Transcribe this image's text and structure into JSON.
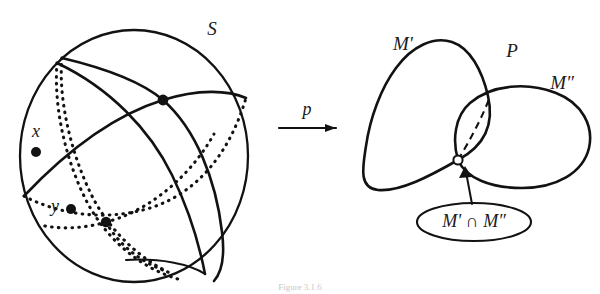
{
  "figure": {
    "kind": "mathematical-diagram",
    "background_color": "#ffffff",
    "ink_color": "#121212"
  },
  "left_panel": {
    "name": "sphere-panel",
    "sphere_label": "S",
    "point_labels": {
      "x": "x",
      "y": "y"
    }
  },
  "map_arrow": {
    "label": "p"
  },
  "right_panel": {
    "name": "quotient-panel",
    "loop_left_label": "M'",
    "space_label": "P",
    "loop_right_label": "M″",
    "intersection_label": "M' ∩ M″"
  },
  "caption": {
    "fragment": "Figure 3.1.6"
  }
}
